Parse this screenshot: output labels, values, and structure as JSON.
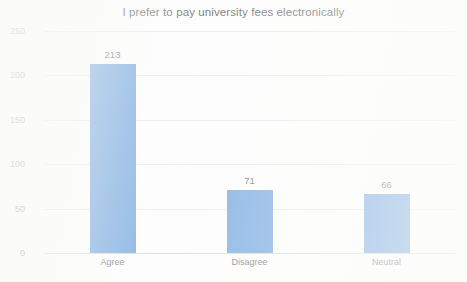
{
  "chart_data": {
    "type": "bar",
    "title": "I prefer to pay university fees electronically",
    "xlabel": "",
    "ylabel": "",
    "categories": [
      "Agree",
      "Disagree",
      "Neutral"
    ],
    "values": [
      213,
      71,
      66
    ],
    "data_labels": [
      "213",
      "71",
      "66"
    ],
    "ylim": [
      0,
      250
    ],
    "ytick_values": [
      0,
      50,
      100,
      150,
      200,
      250
    ],
    "ytick_labels": [
      "0",
      "50",
      "100",
      "150",
      "200",
      "250"
    ],
    "grid": true,
    "grid_axis": "y",
    "legend": false,
    "legend_position": "none",
    "series": [
      {
        "name": "Responses",
        "values": [
          213,
          71,
          66
        ]
      }
    ]
  },
  "colors": {
    "bar": "#6fa4dd",
    "grid": "#e8e8e8",
    "baseline": "#d8d8d8",
    "title_text": "#5d5d5d",
    "tick_text": "#7a7a7a",
    "label_text": "#6a6a6a",
    "background": "#fdfdfd"
  }
}
